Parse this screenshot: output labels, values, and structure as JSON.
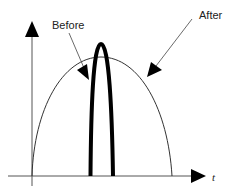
{
  "diagram": {
    "axes": {
      "x_label": "t",
      "y_label": ""
    },
    "curves": [
      {
        "name": "Before",
        "description": "narrow tall pulse",
        "stroke": "#000000",
        "stroke_width": 4
      },
      {
        "name": "After",
        "description": "broad lower pulse",
        "stroke": "#333333",
        "stroke_width": 1
      }
    ],
    "annotations": {
      "before_label": "Before",
      "after_label": "After"
    },
    "colors": {
      "background": "#ffffff",
      "line": "#000000",
      "text": "#222222"
    }
  }
}
